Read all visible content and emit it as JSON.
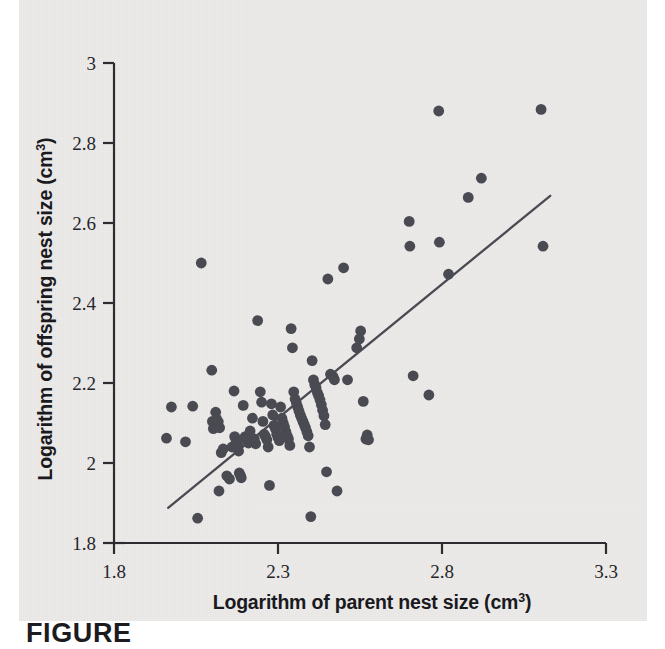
{
  "figure": {
    "caption_partial": "FIGURE",
    "panel_bg": "#ecebe9",
    "ink_color": "#4a4a52",
    "axis_color": "#2b2b30"
  },
  "chart_data": {
    "type": "scatter",
    "title": "",
    "xlabel": "Logarithm of parent nest size (cm",
    "xlabel_sup": "3",
    "xlabel_tail": ")",
    "ylabel": "Logarithm of offspring nest size (cm",
    "ylabel_sup": "3",
    "ylabel_tail": ")",
    "xlim": [
      1.8,
      3.3
    ],
    "ylim": [
      1.8,
      3.0
    ],
    "xticks": [
      1.8,
      2.3,
      2.8,
      3.3
    ],
    "xtick_labels": [
      "1.8",
      "2.3",
      "2.8",
      "3.3"
    ],
    "yticks": [
      1.8,
      2.0,
      2.2,
      2.4,
      2.6,
      2.8,
      3.0
    ],
    "ytick_labels": [
      "1.8",
      "2",
      "2.2",
      "2.4",
      "2.6",
      "2.8",
      "3"
    ],
    "grid": false,
    "legend": null,
    "marker": {
      "shape": "circle",
      "radius_px": 5.4,
      "color": "#4a4a52"
    },
    "trendline": {
      "type": "linear",
      "color": "#4a4a52",
      "x_start": 1.965,
      "y_start": 1.888,
      "x_end": 3.13,
      "y_end": 2.668
    },
    "points": [
      [
        1.96,
        2.062
      ],
      [
        1.975,
        2.14
      ],
      [
        2.018,
        2.053
      ],
      [
        2.04,
        2.142
      ],
      [
        2.055,
        1.862
      ],
      [
        2.066,
        2.5
      ],
      [
        2.098,
        2.232
      ],
      [
        2.1,
        2.104
      ],
      [
        2.103,
        2.086
      ],
      [
        2.11,
        2.127
      ],
      [
        2.113,
        2.11
      ],
      [
        2.118,
        2.103
      ],
      [
        2.122,
        2.088
      ],
      [
        2.12,
        1.93
      ],
      [
        2.127,
        2.026
      ],
      [
        2.133,
        2.035
      ],
      [
        2.144,
        1.968
      ],
      [
        2.152,
        1.96
      ],
      [
        2.16,
        2.04
      ],
      [
        2.166,
        2.18
      ],
      [
        2.168,
        2.066
      ],
      [
        2.172,
        2.058
      ],
      [
        2.174,
        2.052
      ],
      [
        2.178,
        2.044
      ],
      [
        2.18,
        2.03
      ],
      [
        2.182,
        1.975
      ],
      [
        2.186,
        1.968
      ],
      [
        2.188,
        1.963
      ],
      [
        2.194,
        2.144
      ],
      [
        2.2,
        2.066
      ],
      [
        2.205,
        2.058
      ],
      [
        2.21,
        2.05
      ],
      [
        2.215,
        2.08
      ],
      [
        2.222,
        2.112
      ],
      [
        2.228,
        2.06
      ],
      [
        2.232,
        2.048
      ],
      [
        2.238,
        2.356
      ],
      [
        2.246,
        2.178
      ],
      [
        2.25,
        2.152
      ],
      [
        2.254,
        2.104
      ],
      [
        2.258,
        2.072
      ],
      [
        2.262,
        2.066
      ],
      [
        2.266,
        2.058
      ],
      [
        2.27,
        2.04
      ],
      [
        2.274,
        1.944
      ],
      [
        2.28,
        2.148
      ],
      [
        2.284,
        2.12
      ],
      [
        2.288,
        2.094
      ],
      [
        2.292,
        2.086
      ],
      [
        2.296,
        2.072
      ],
      [
        2.3,
        2.064
      ],
      [
        2.304,
        2.056
      ],
      [
        2.308,
        2.14
      ],
      [
        2.312,
        2.112
      ],
      [
        2.316,
        2.1
      ],
      [
        2.32,
        2.09
      ],
      [
        2.324,
        2.078
      ],
      [
        2.328,
        2.068
      ],
      [
        2.332,
        2.06
      ],
      [
        2.336,
        2.044
      ],
      [
        2.34,
        2.336
      ],
      [
        2.344,
        2.288
      ],
      [
        2.348,
        2.178
      ],
      [
        2.352,
        2.16
      ],
      [
        2.356,
        2.15
      ],
      [
        2.36,
        2.14
      ],
      [
        2.364,
        2.13
      ],
      [
        2.368,
        2.12
      ],
      [
        2.372,
        2.112
      ],
      [
        2.376,
        2.104
      ],
      [
        2.38,
        2.096
      ],
      [
        2.384,
        2.088
      ],
      [
        2.388,
        2.078
      ],
      [
        2.392,
        2.068
      ],
      [
        2.396,
        2.04
      ],
      [
        2.4,
        1.866
      ],
      [
        2.404,
        2.256
      ],
      [
        2.408,
        2.208
      ],
      [
        2.412,
        2.196
      ],
      [
        2.416,
        2.188
      ],
      [
        2.42,
        2.176
      ],
      [
        2.424,
        2.168
      ],
      [
        2.428,
        2.158
      ],
      [
        2.432,
        2.146
      ],
      [
        2.436,
        2.132
      ],
      [
        2.44,
        2.118
      ],
      [
        2.444,
        2.096
      ],
      [
        2.448,
        1.978
      ],
      [
        2.452,
        2.46
      ],
      [
        2.46,
        2.222
      ],
      [
        2.468,
        2.216
      ],
      [
        2.472,
        2.208
      ],
      [
        2.48,
        1.93
      ],
      [
        2.5,
        2.488
      ],
      [
        2.512,
        2.208
      ],
      [
        2.54,
        2.288
      ],
      [
        2.548,
        2.31
      ],
      [
        2.552,
        2.33
      ],
      [
        2.56,
        2.154
      ],
      [
        2.568,
        2.06
      ],
      [
        2.572,
        2.07
      ],
      [
        2.576,
        2.058
      ],
      [
        2.7,
        2.604
      ],
      [
        2.702,
        2.542
      ],
      [
        2.712,
        2.218
      ],
      [
        2.76,
        2.17
      ],
      [
        2.79,
        2.88
      ],
      [
        2.792,
        2.552
      ],
      [
        2.82,
        2.472
      ],
      [
        2.88,
        2.664
      ],
      [
        2.92,
        2.712
      ],
      [
        3.102,
        2.884
      ],
      [
        3.108,
        2.542
      ]
    ]
  }
}
